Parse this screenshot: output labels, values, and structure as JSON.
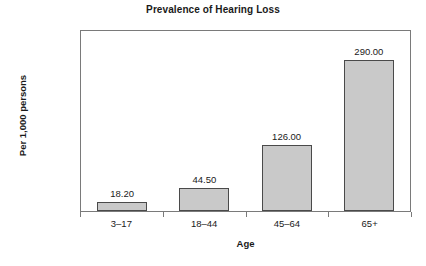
{
  "chart_data": {
    "type": "bar",
    "title": "Prevalence of Hearing Loss",
    "xlabel": "Age",
    "ylabel": "Per 1,000 persons",
    "categories": [
      "3–17",
      "18–44",
      "45–64",
      "65+"
    ],
    "values": [
      18.2,
      44.5,
      126.0,
      290.0
    ],
    "value_labels": [
      "18.20",
      "44.50",
      "126.00",
      "290.00"
    ],
    "ylim": [
      0,
      350
    ],
    "ytick_values": [
      0,
      50,
      100,
      150,
      200,
      250,
      300,
      350
    ],
    "ytick_labels": [
      "0.00",
      "50.00",
      "100.00",
      "150.00",
      "200.00",
      "250.00",
      "300.00",
      "350.00"
    ],
    "grid": false,
    "legend": "none",
    "bar_color": "#c9c9c9",
    "bar_border_color": "#4a4a4a",
    "axis_color": "#7a7a7a",
    "text_color": "#1a1a1a",
    "background": "#ffffff"
  }
}
